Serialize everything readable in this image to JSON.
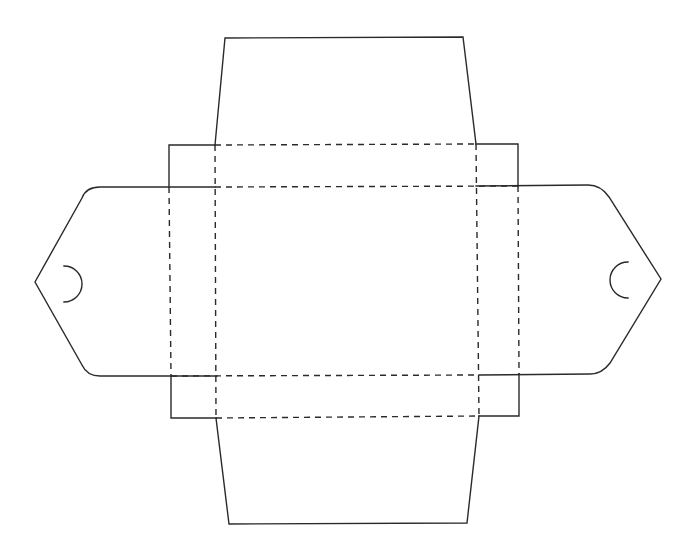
{
  "diagram": {
    "type": "box-dieline-template",
    "colors": {
      "background": "#ffffff",
      "line": "#2a2a2a"
    },
    "legend": {
      "cut_line": "solid",
      "fold_line": "dashed"
    },
    "parts": [
      {
        "name": "top-flap",
        "shape": "trapezoid"
      },
      {
        "name": "bottom-flap",
        "shape": "trapezoid"
      },
      {
        "name": "left-tuck-tab",
        "shape": "pointed tab with semicircle slit"
      },
      {
        "name": "right-tuck-tab",
        "shape": "pointed tab with semicircle slit"
      },
      {
        "name": "top-left-dust-flap",
        "shape": "rectangle"
      },
      {
        "name": "top-right-dust-flap",
        "shape": "rectangle"
      },
      {
        "name": "bottom-left-dust-flap",
        "shape": "rectangle"
      },
      {
        "name": "bottom-right-dust-flap",
        "shape": "rectangle"
      },
      {
        "name": "base-panel",
        "shape": "rectangle"
      }
    ]
  }
}
